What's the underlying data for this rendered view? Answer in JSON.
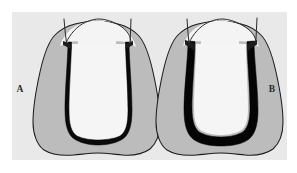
{
  "figure": {
    "caption_labels": {
      "left": "A",
      "right": "B"
    },
    "panel_background": "#e9e9e9",
    "page_background": "#ffffff",
    "colors": {
      "dentin_gray": "#bcbcbc",
      "enamel_light": "#f2f2f2",
      "pulp_light": "#f5f5f5",
      "outline_dark": "#1c1c1c",
      "cement_black": "#000000",
      "label_color": "#2b2b2b"
    },
    "diagram_type": "dental-crown-preparation-cross-section",
    "panels": [
      {
        "id": "panel-a",
        "label": "A",
        "label_position": {
          "x": 20,
          "y": 89
        },
        "description_parts": [
          "tooth-outline",
          "dentin-gray-layer",
          "cement-margin-black-thin",
          "pulp-core-light",
          "gingival-margin-line-left",
          "gingival-margin-line-right"
        ],
        "margin_thickness": "thin"
      },
      {
        "id": "panel-b",
        "label": "B",
        "label_position": {
          "x": 272,
          "y": 89
        },
        "description_parts": [
          "tooth-outline",
          "dentin-gray-layer",
          "cement-margin-black-thick",
          "pulp-core-light",
          "gingival-margin-line-left",
          "gingival-margin-line-right"
        ],
        "margin_thickness": "thick"
      }
    ]
  }
}
